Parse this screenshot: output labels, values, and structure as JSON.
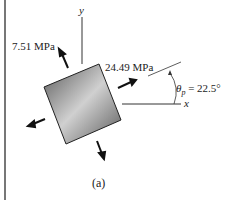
{
  "figure": {
    "axis_y_label": "y",
    "axis_x_label": "x",
    "stress_1": "7.51 MPa",
    "stress_2": "24.49 MPa",
    "angle_symbol": "θ",
    "angle_subscript": "p",
    "angle_value": "= 22.5°",
    "caption": "(a)"
  },
  "colors": {
    "element_dark": "#555555",
    "element_light": "#cfcfcf",
    "line": "#333333"
  }
}
